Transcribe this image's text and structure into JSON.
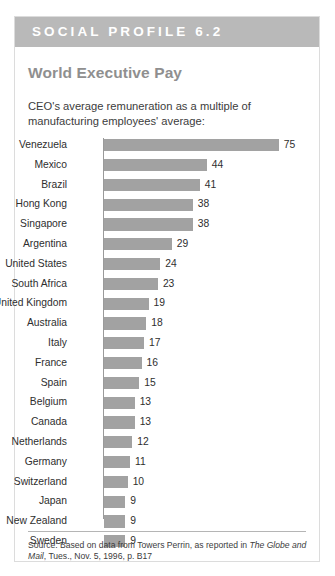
{
  "card": {
    "header_label": "SOCIAL PROFILE 6.2",
    "header_bg": "#b9b9b9",
    "border_color": "#dcdcdc",
    "background": "#ffffff"
  },
  "chart_data": {
    "type": "bar",
    "orientation": "horizontal",
    "title": "World Executive Pay",
    "subtitle": "CEO's average remuneration as a multiple of manufacturing employees' average:",
    "xlabel": "",
    "ylabel": "",
    "grid": false,
    "legend": null,
    "axis_visible": true,
    "value_labels": true,
    "bar_color": "#a2a2a2",
    "xlim": [
      0,
      75
    ],
    "categories": [
      "Venezuela",
      "Mexico",
      "Brazil",
      "Hong Kong",
      "Singapore",
      "Argentina",
      "United States",
      "South Africa",
      "United Kingdom",
      "Australia",
      "Italy",
      "France",
      "Spain",
      "Belgium",
      "Canada",
      "Netherlands",
      "Germany",
      "Switzerland",
      "Japan",
      "New Zealand",
      "Sweden"
    ],
    "values": [
      75,
      44,
      41,
      38,
      38,
      29,
      24,
      23,
      19,
      18,
      17,
      16,
      15,
      13,
      13,
      12,
      11,
      10,
      9,
      9,
      9
    ]
  },
  "source": {
    "prefix": "Source: Based on data from Towers Perrin, as reported in ",
    "publication": "The Globe and Mail",
    "suffix": ", Tues., Nov. 5, 1996, p. B17"
  }
}
